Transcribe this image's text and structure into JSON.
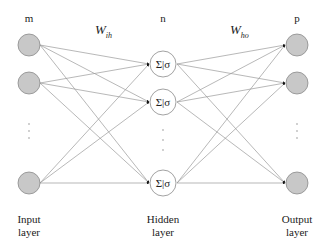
{
  "diagram": {
    "type": "feedforward-neural-network",
    "layers": [
      {
        "id": "input",
        "count_label": "m",
        "name_line1": "Input",
        "name_line2": "layer",
        "visible_nodes": 3,
        "node_fill": "#c8c8c8"
      },
      {
        "id": "hidden",
        "count_label": "n",
        "name_line1": "Hidden",
        "name_line2": "layer",
        "visible_nodes": 3,
        "node_symbol": "Σ|σ",
        "node_fill": "#ffffff"
      },
      {
        "id": "output",
        "count_label": "p",
        "name_line1": "Output",
        "name_line2": "layer",
        "visible_nodes": 3,
        "node_fill": "#c8c8c8"
      }
    ],
    "weights": {
      "input_hidden": {
        "symbol": "W",
        "subscript": "ih"
      },
      "hidden_output": {
        "symbol": "W",
        "subscript": "ho"
      }
    },
    "ellipsis": "⋮",
    "colors": {
      "node_stroke": "#888888",
      "edge": "#999999",
      "text": "#222222"
    }
  }
}
